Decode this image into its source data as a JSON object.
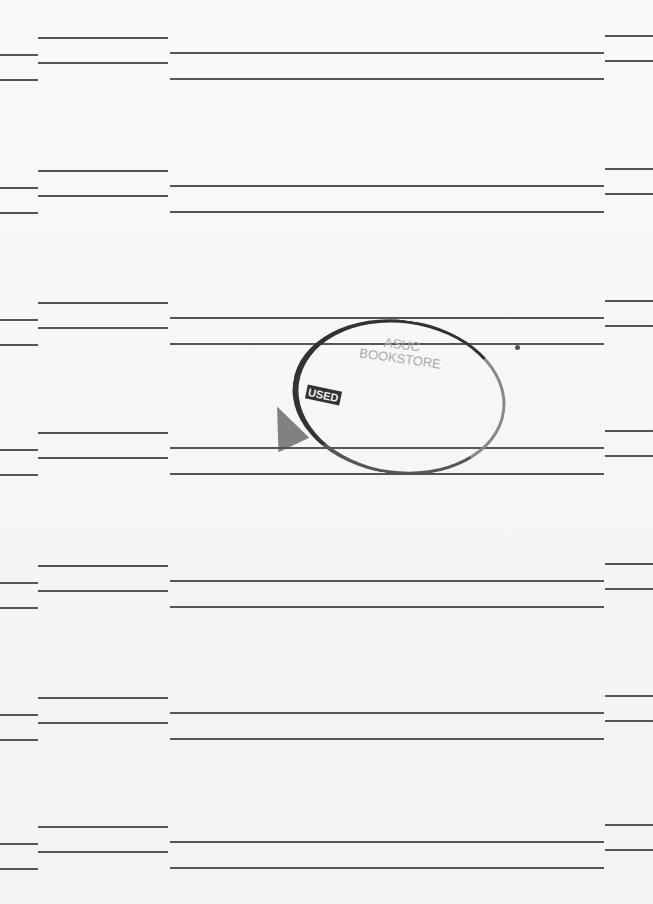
{
  "document": {
    "type": "blank ruled page scan",
    "stamp": {
      "line1": "ASUC",
      "line2": "BOOKSTORE",
      "label": "USED"
    },
    "line_groups_y": [
      37,
      170,
      302,
      432,
      565,
      697,
      826
    ],
    "colors": {
      "paper": "#f7f7f7",
      "ink": "#555555"
    }
  }
}
